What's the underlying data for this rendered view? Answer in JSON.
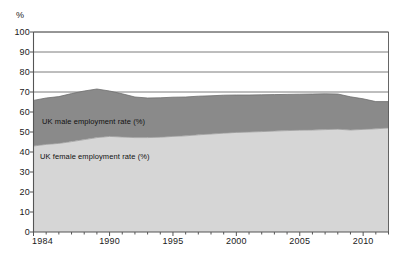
{
  "axis_unit_label": "%",
  "series_labels": {
    "male": "UK male employment rate (%)",
    "female": "UK female employment rate (%)"
  },
  "yticks": [
    "0",
    "10",
    "20",
    "30",
    "40",
    "50",
    "60",
    "70",
    "80",
    "90",
    "100"
  ],
  "xticks": [
    "1984",
    "1990",
    "1995",
    "2000",
    "2005",
    "2010"
  ],
  "colors": {
    "male_fill": "#8a8a8a",
    "female_fill": "#d6d6d6",
    "axis": "#555555",
    "grid": "#5a5a5a",
    "text": "#1a1a1a"
  },
  "chart_data": {
    "type": "area",
    "title": "",
    "subtitle": "",
    "xlabel": "",
    "ylabel": "%",
    "ylim": [
      0,
      100
    ],
    "xlim": [
      1984,
      2012
    ],
    "grid": true,
    "stacked": true,
    "legend_position": "inline-annotation",
    "yticks": [
      0,
      10,
      20,
      30,
      40,
      50,
      60,
      70,
      80,
      90,
      100
    ],
    "xtick_labels": [
      1984,
      1990,
      1995,
      2000,
      2005,
      2010
    ],
    "x": [
      1984,
      1985,
      1986,
      1987,
      1988,
      1989,
      1990,
      1991,
      1992,
      1993,
      1994,
      1995,
      1996,
      1997,
      1998,
      1999,
      2000,
      2001,
      2002,
      2003,
      2004,
      2005,
      2006,
      2007,
      2008,
      2009,
      2010,
      2011,
      2012
    ],
    "series": [
      {
        "name": "UK female employment rate (%)",
        "values": [
          43.0,
          43.8,
          44.3,
          45.2,
          46.2,
          47.2,
          47.8,
          47.5,
          47.2,
          47.2,
          47.4,
          47.8,
          48.1,
          48.6,
          49.0,
          49.4,
          49.8,
          50.0,
          50.2,
          50.5,
          50.7,
          50.9,
          51.0,
          51.2,
          51.4,
          51.0,
          51.3,
          51.6,
          52.0
        ]
      },
      {
        "name": "UK male employment rate (%)",
        "values": [
          22.8,
          23.2,
          23.4,
          24.0,
          24.3,
          24.3,
          22.7,
          21.6,
          20.3,
          19.8,
          19.7,
          19.6,
          19.4,
          19.3,
          19.1,
          19.0,
          18.7,
          18.5,
          18.4,
          18.2,
          18.1,
          18.0,
          18.0,
          17.9,
          17.6,
          16.6,
          15.3,
          13.6,
          13.2
        ]
      }
    ],
    "totals": [
      65.8,
      67.0,
      67.7,
      69.2,
      70.5,
      71.5,
      70.5,
      69.1,
      67.5,
      67.0,
      67.1,
      67.4,
      67.5,
      67.9,
      68.1,
      68.4,
      68.5,
      68.5,
      68.6,
      68.7,
      68.8,
      68.9,
      69.0,
      69.1,
      69.0,
      67.6,
      66.6,
      65.2,
      65.2
    ]
  }
}
